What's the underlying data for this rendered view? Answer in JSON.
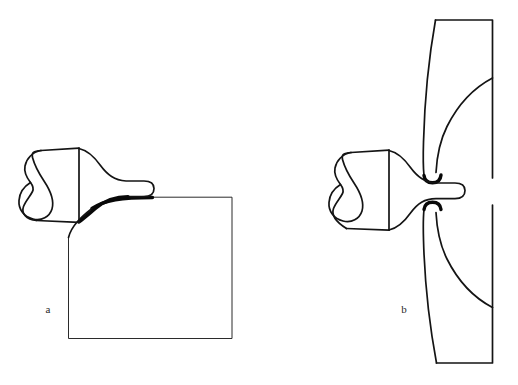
{
  "figure": {
    "background_color": "#ffffff",
    "ink_color": "#141414",
    "width": 518,
    "height": 385,
    "panels": [
      {
        "id": "a",
        "label": "a",
        "label_x": 48,
        "label_y": 313,
        "description": "Flared attachment seated on the rounded corner of a large rectangular block",
        "parts": [
          {
            "name": "left-bulb",
            "label": "",
            "description": "Rounded lobed head at left with an internal loop fold"
          },
          {
            "name": "neck-block",
            "label": "",
            "description": "Quadrilateral body between bulb and flare"
          },
          {
            "name": "flared-shaft",
            "label": "",
            "description": "Tapering trumpet-shaped shaft ending in a rounded tip"
          },
          {
            "name": "substrate-block",
            "label": "",
            "description": "Large rectangle with a rounded upper-left corner drawn with a bold arc"
          }
        ]
      },
      {
        "id": "b",
        "label": "b",
        "label_x": 404,
        "label_y": 313,
        "description": "Same attachment passing through a slit in a curved vertical band",
        "parts": [
          {
            "name": "left-bulb",
            "label": "",
            "description": "Rounded lobed head at left with an internal loop fold"
          },
          {
            "name": "neck-block",
            "label": "",
            "description": "Quadrilateral body between bulb and flare"
          },
          {
            "name": "flared-shaft",
            "label": "",
            "description": "Tapering shaft with rounded tip inserted through the band"
          },
          {
            "name": "curved-band",
            "label": "",
            "description": "Tall curved band split by a narrow gap, with two internal arcs"
          }
        ]
      }
    ],
    "labels": [
      "a",
      "b"
    ]
  }
}
